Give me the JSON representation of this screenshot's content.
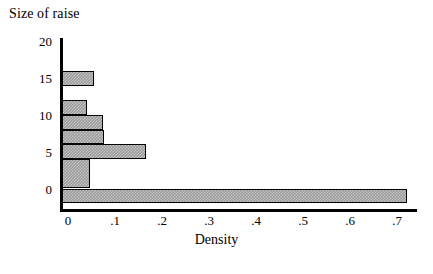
{
  "chart_data": {
    "type": "bar",
    "orientation": "horizontal",
    "title": "Size of raise",
    "xlabel": "Density",
    "ylabel": "Size of raise",
    "grid": false,
    "legend": null,
    "xlim": [
      0,
      0.757
    ],
    "ylim": [
      -2.2,
      20
    ],
    "xticks": [
      "0",
      ".1",
      ".2",
      ".3",
      ".4",
      ".5",
      ".6",
      ".7"
    ],
    "xtick_values": [
      0,
      0.1,
      0.2,
      0.3,
      0.4,
      0.5,
      0.6,
      0.7
    ],
    "yticks": [
      "20",
      "15",
      "10",
      "5",
      "0"
    ],
    "ytick_values": [
      20,
      15,
      10,
      5,
      0
    ],
    "bins": [
      {
        "label": "14 to 16",
        "y_low": 14,
        "y_high": 16,
        "value": 0.055
      },
      {
        "label": "10 to 12",
        "y_low": 10,
        "y_high": 12,
        "value": 0.04
      },
      {
        "label": "8 to 10",
        "y_low": 8,
        "y_high": 10,
        "value": 0.075
      },
      {
        "label": "6 to 8",
        "y_low": 6,
        "y_high": 8,
        "value": 0.077
      },
      {
        "label": "4 to 6",
        "y_low": 4,
        "y_high": 6,
        "value": 0.166
      },
      {
        "label": "0 to 4",
        "y_low": 0,
        "y_high": 4,
        "value": 0.047
      },
      {
        "label": "-2 to 0",
        "y_low": -2,
        "y_high": 0,
        "value": 0.722
      }
    ],
    "categories": [
      "14 to 16",
      "10 to 12",
      "8 to 10",
      "6 to 8",
      "4 to 6",
      "0 to 4",
      "-2 to 0"
    ],
    "values": [
      0.055,
      0.04,
      0.075,
      0.077,
      0.166,
      0.047,
      0.722
    ],
    "colors": {
      "bar_fill": "#9a9a9a",
      "bar_edge": "#000000",
      "axis": "#000000",
      "background": "#ffffff"
    }
  }
}
